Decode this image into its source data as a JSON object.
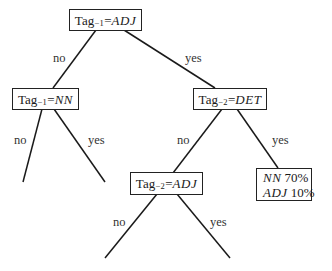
{
  "diagram": {
    "type": "decision-tree",
    "nodes": {
      "root": {
        "prefix": "Tag",
        "sub": "−1",
        "eq": "=",
        "value": "ADJ"
      },
      "left": {
        "prefix": "Tag",
        "sub": "−1",
        "eq": "=",
        "value": "NN"
      },
      "right": {
        "prefix": "Tag",
        "sub": "−2",
        "eq": "=",
        "value": "DET"
      },
      "mid": {
        "prefix": "Tag",
        "sub": "−2",
        "eq": "=",
        "value": "ADJ"
      },
      "leaf": {
        "rows": [
          {
            "tag": "NN",
            "pct": "70%"
          },
          {
            "tag": "ADJ",
            "pct": "10%"
          }
        ]
      }
    },
    "edge_labels": {
      "root_no": "no",
      "root_yes": "yes",
      "left_no": "no",
      "left_yes": "yes",
      "right_no": "no",
      "right_yes": "yes",
      "mid_no": "no",
      "mid_yes": "yes"
    }
  }
}
